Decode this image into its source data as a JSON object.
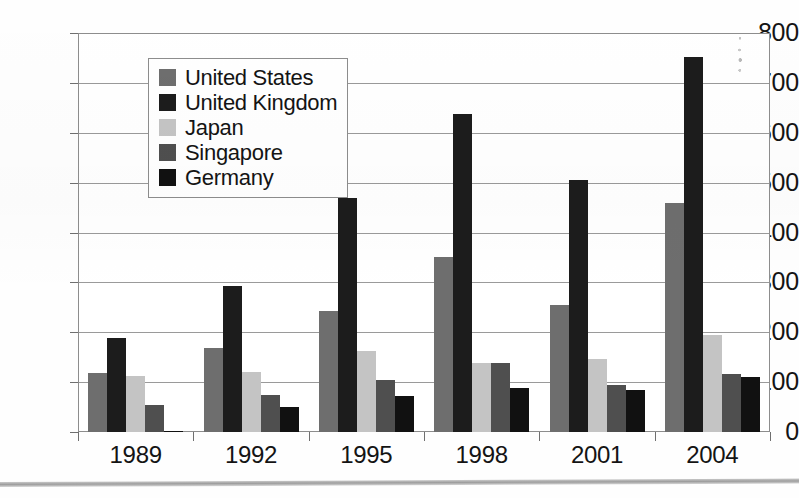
{
  "chart_data": {
    "type": "bar",
    "title": "",
    "xlabel": "",
    "ylabel": "",
    "categories": [
      "1989",
      "1992",
      "1995",
      "1998",
      "2001",
      "2004"
    ],
    "series": [
      {
        "name": "United States",
        "color": "#6e6e6e",
        "values": [
          118,
          169,
          242,
          350,
          254,
          460
        ]
      },
      {
        "name": "United Kingdom",
        "color": "#1c1c1c",
        "values": [
          188,
          292,
          470,
          638,
          505,
          752
        ]
      },
      {
        "name": "Japan",
        "color": "#c4c4c4",
        "values": [
          112,
          121,
          162,
          138,
          147,
          194
        ]
      },
      {
        "name": "Singapore",
        "color": "#4f4f4f",
        "values": [
          54,
          75,
          105,
          139,
          95,
          116
        ]
      },
      {
        "name": "Germany",
        "color": "#111111",
        "values": [
          3,
          51,
          73,
          89,
          85,
          110
        ]
      }
    ],
    "ylim": [
      0,
      800
    ],
    "yticks": [
      0,
      100,
      200,
      300,
      400,
      500,
      600,
      700,
      800
    ],
    "ytick_labels": [
      "0",
      "100",
      "200",
      "300",
      "400",
      "500",
      "600",
      "700",
      "800"
    ],
    "grid": true,
    "legend_position": "upper-left-inside",
    "legend_entries": [
      "United States",
      "United Kingdom",
      "Japan",
      "Singapore",
      "Germany"
    ],
    "plot_background": "#ffffff",
    "grid_color": "#9a9a9a",
    "axis_color": "#8d8d8d",
    "text_color": "#141414"
  }
}
